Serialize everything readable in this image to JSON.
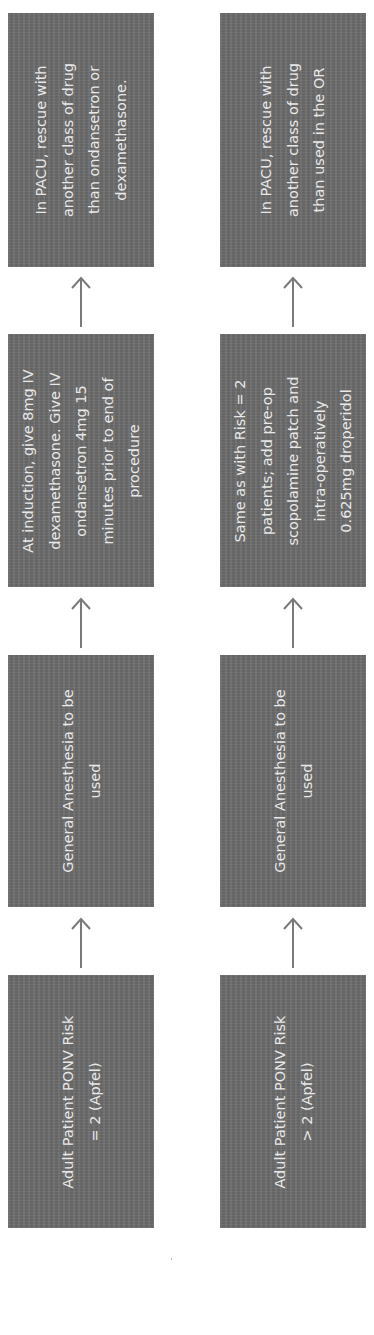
{
  "diagram": {
    "orientation": "rotated-90-ccw",
    "colors": {
      "box_fill": "#6c6c6c",
      "box_text": "#e8e8e8",
      "arrow": "#7a7a7a",
      "background": "#ffffff"
    },
    "rows": [
      {
        "name": "risk-equal-2",
        "steps": [
          {
            "label": "Adult Patient PONV Risk\n= 2 (Apfel)"
          },
          {
            "label": "General Anesthesia to be\nused"
          },
          {
            "label": "At induction, give 8mg IV\ndexamethasone. Give IV\nondansetron 4mg 15\nminutes prior to end of\nprocedure"
          },
          {
            "label": "In PACU, rescue with\nanother class of drug\nthan ondansetron or\ndexamethasone."
          }
        ]
      },
      {
        "name": "risk-greater-2",
        "steps": [
          {
            "label": "Adult Patient PONV Risk\n> 2 (Apfel)"
          },
          {
            "label": "General Anesthesia to be\nused"
          },
          {
            "label": "Same as with Risk = 2\npatients; add pre-op\nscopolamine patch and\nintra-operatively\n0.625mg droperidol"
          },
          {
            "label": "In PACU, rescue with\nanother class of drug\nthan used in the OR"
          }
        ]
      }
    ]
  }
}
